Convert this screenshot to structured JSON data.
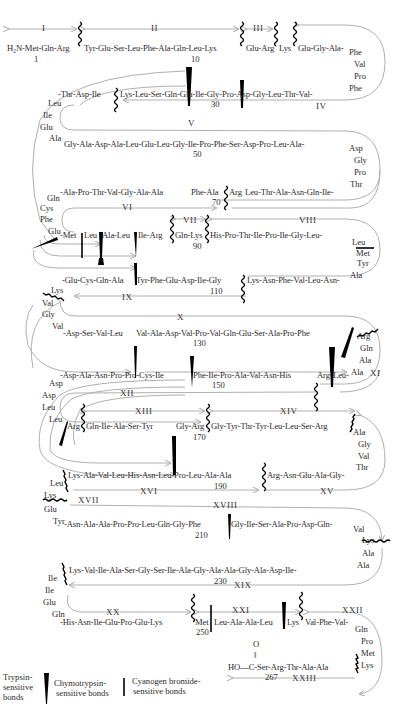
{
  "rows": {
    "r1": "H₂N-Met-Gln-Arg",
    "r1b": "Tyr-Glu-Ser-Leu-Phe-Ala-Gln-Leu-Lys",
    "r1c": "Glu-Arg",
    "r1d": "Lys",
    "r1e": "Glu-Gly-Ala-",
    "r1_turn": [
      "Phe",
      "Val",
      "Pro",
      "Phe"
    ],
    "r2a": "-Thr-Asp-Ile",
    "r2b": "Lys-Leu-Ser-Gln-Glu-Ile-Gly-Pro-Asp-Gly-Leu-Thr-Val-",
    "r2_turn": [
      "Leu",
      "Ile",
      "Glu",
      "Ala"
    ],
    "r3": "Gly-Ala-Asp-Ala-Leu-Glu-Leu-Gly-Ile-Pro-Phe-Ser-Asp-Pro-Leu-Ala-",
    "r3_turn": [
      "Asp",
      "Gly",
      "Pro",
      "Thr"
    ],
    "r4a": "-Ala-Pro-Thr-Val-Gly-Ala-Ala",
    "r4b": "Phe-Ala",
    "r4c": "Arg",
    "r4d": "Leu-Thr-Ala-Asn-Gln-Ile-",
    "r4_turn": [
      "Gln",
      "Cys",
      "Phe",
      "Glu"
    ],
    "r5a": "-Met",
    "r5b": "Leu",
    "r5c": "Ala-Leu",
    "r5d": "Ile-Arg",
    "r5e": "Gln-Lys",
    "r5f": "His-Pro-Thr-Ile-Pro-Ile-Gly-Leu-",
    "r5_turn": [
      "Leu",
      "Met",
      "Tyr",
      "Ala"
    ],
    "r6a": "-Glu-Cys-Gln-Ala",
    "r6b": "Tyr-Phe-Glu-Asp-Ile-Gly",
    "r6c": "Lys-Asn-Phe-Val-Leu-Asn-",
    "r6_turn": [
      "Lys",
      "Val",
      "Gly",
      "Val"
    ],
    "r7a": "-Asp-Ser-Val-Leu",
    "r7b": "Val-Ala-Asp-Val-Pro-Val-Gln-Glu-Ser-Ala-Pro-Phe",
    "r7_turn": [
      "Arg",
      "Gln",
      "Ala",
      "Ala"
    ],
    "r8a": "-Asp-Ala-Asn-Pro-Pro-Cys-Ile",
    "r8b": "Phe-Ile-Pro-Ala-Val-Asn-His",
    "r8c": "Arg",
    "r8d": "Leu-",
    "r8_turn": [
      "Asp",
      "Asp",
      "Leu",
      "Leu"
    ],
    "r9a": "Arg",
    "r9b": "Gln-Ile-Ala-Ser-Tyr",
    "r9c": "Gly-Arg",
    "r9d": "Gly-Tyr-Thr-Tyr-Leu-Leu-Ser-Arg",
    "r9_turn": [
      "Ala",
      "Gly",
      "Val",
      "Thr"
    ],
    "r10a": "Lys-Ala-Val-Leu-His-Asn-Leu-Pro-Leu-Ala-Ala",
    "r10b": "Arg-Asn-Glu-Ala-Gly-",
    "r10_turn": [
      "Leu",
      "Lys",
      "Glu",
      "Tyr"
    ],
    "r11a": "-Asn-Ala-Ala-Pro-Pro-Leu-Gln-Gly-Phe",
    "r11b": "Gly-Ile-Ser-Ala-Pro-Asp-Gln-",
    "r11_turn": [
      "Val",
      "Lys",
      "Ala",
      "Ala"
    ],
    "r12": "Lys-Val-Ile-Ala-Ser-Gly-Ser-Ile-Ala-Gly-Ala-Ala-Gly-Ala-Asp-Ile-",
    "r12_turn": [
      "Ile",
      "Ile",
      "Glu",
      "Gln"
    ],
    "r13a": "-His-Asn-Ile-Glu-Pro-Glu-Lys",
    "r13b": "Met",
    "r13c": "Leu-Ala-Ala-Leu",
    "r13d": "Lys",
    "r13e": "Val-Phe-Val-",
    "r13_turn": [
      "Gln",
      "Pro",
      "Met",
      "Lys"
    ],
    "r14": "HO—C-Ser-Arg-Thr-Ala-Ala",
    "r14_o": "O",
    "r14_dbl": "‖"
  },
  "residue_numbers": {
    "n1": "1",
    "n10": "10",
    "n30": "30",
    "n50": "50",
    "n70": "70",
    "n90": "90",
    "n110": "110",
    "n130": "130",
    "n150": "150",
    "n170": "170",
    "n190": "190",
    "n210": "210",
    "n230": "230",
    "n250": "250",
    "n267": "267"
  },
  "segments": {
    "I": "I",
    "II": "II",
    "III": "III",
    "IV": "IV",
    "V": "V",
    "VI": "VI",
    "VII": "VII",
    "VIII": "VIII",
    "IX": "IX",
    "X": "X",
    "XI": "XI",
    "XII": "XII",
    "XIII": "XIII",
    "XIV": "XIV",
    "XV": "XV",
    "XVI": "XVI",
    "XVII": "XVII",
    "XVIII": "XVIII",
    "XIX": "XIX",
    "XX": "XX",
    "XXI": "XXI",
    "XXII": "XXII",
    "XXIII": "XXIII"
  },
  "legend": {
    "trypsin": "Trypsin-\nsensitive\nbonds",
    "trypsin_l1": "Trypsin-",
    "trypsin_l2": "sensitive",
    "trypsin_l3": "bonds",
    "chymo_l1": "Chymotrypsin-",
    "chymo_l2": "sensitive bonds",
    "cnbr_l1": "Cyanogen bromide-",
    "cnbr_l2": "sensitive bonds"
  },
  "colors": {
    "text": "#2a2a2a",
    "line": "#a8a8a8",
    "marker": "#000000"
  }
}
